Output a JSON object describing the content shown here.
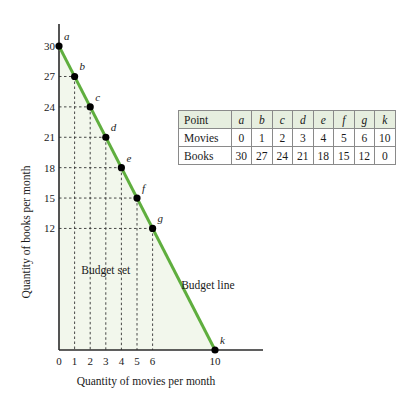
{
  "chart_data": {
    "type": "line",
    "title": "",
    "xlabel": "Quantity of movies per month",
    "ylabel": "Quantity of books per month",
    "xlim": [
      0,
      10
    ],
    "ylim": [
      0,
      30
    ],
    "x_ticks": [
      0,
      1,
      2,
      3,
      4,
      5,
      6,
      10
    ],
    "y_ticks": [
      12,
      15,
      18,
      21,
      24,
      27,
      30
    ],
    "grid": false,
    "dashed_guides": true,
    "series": [
      {
        "name": "Budget line",
        "color": "#5fae3e",
        "points": [
          {
            "label": "a",
            "x": 0,
            "y": 30
          },
          {
            "label": "b",
            "x": 1,
            "y": 27
          },
          {
            "label": "c",
            "x": 2,
            "y": 24
          },
          {
            "label": "d",
            "x": 3,
            "y": 21
          },
          {
            "label": "e",
            "x": 4,
            "y": 18
          },
          {
            "label": "f",
            "x": 5,
            "y": 15
          },
          {
            "label": "g",
            "x": 6,
            "y": 12
          },
          {
            "label": "k",
            "x": 10,
            "y": 0
          }
        ]
      }
    ],
    "annotations": [
      {
        "text": "Budget set",
        "x": 2.2,
        "y": 7.5
      },
      {
        "text": "Budget line",
        "x": 8.6,
        "y": 6.0
      }
    ],
    "shaded_region": {
      "name": "Budget set",
      "color": "#f2f7ec"
    },
    "table": {
      "headers": [
        "Point",
        "a",
        "b",
        "c",
        "d",
        "e",
        "f",
        "g",
        "k"
      ],
      "rows": [
        [
          "Movies",
          "0",
          "1",
          "2",
          "3",
          "4",
          "5",
          "6",
          "10"
        ],
        [
          "Books",
          "30",
          "27",
          "24",
          "21",
          "18",
          "15",
          "12",
          "0"
        ]
      ],
      "header_bg": "#e6eedf"
    }
  }
}
